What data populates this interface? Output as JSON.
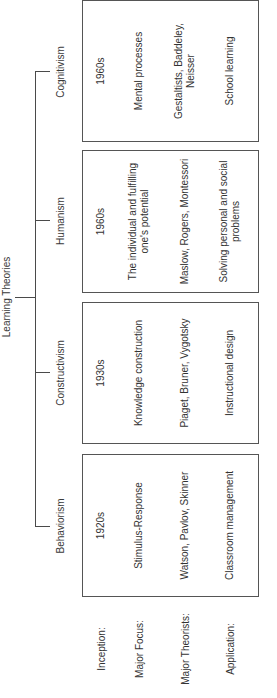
{
  "diagram": {
    "title": "Learning Theories",
    "row_labels": {
      "inception": "Inception:",
      "focus": "Major Focus:",
      "theorists": "Major Theorists:",
      "application": "Application:"
    },
    "theories": [
      {
        "name": "Behaviorism",
        "inception": "1920s",
        "focus": "Stimulus-Response",
        "theorists": "Watson, Pavlov, Skinner",
        "application": "Classroom management"
      },
      {
        "name": "Constructivism",
        "inception": "1930s",
        "focus": "Knowledge construction",
        "theorists": "Piaget, Bruner, Vygotsky",
        "application": "Instructional design"
      },
      {
        "name": "Humanism",
        "inception": "1960s",
        "focus": "The individual and fulfilling one's potential",
        "theorists": "Maslow, Rogers, Montessori",
        "application": "Solving personal and social problems"
      },
      {
        "name": "Cognitivism",
        "inception": "1960s",
        "focus": "Mental processes",
        "theorists": "Gestaltists, Baddeley, Neisser",
        "application": "School learning"
      }
    ],
    "colors": {
      "line": "#4a4a4a",
      "box_border": "#555555",
      "text": "#333333",
      "background": "#ffffff"
    },
    "orientation": "rotated 90 degrees counter-clockwise"
  }
}
